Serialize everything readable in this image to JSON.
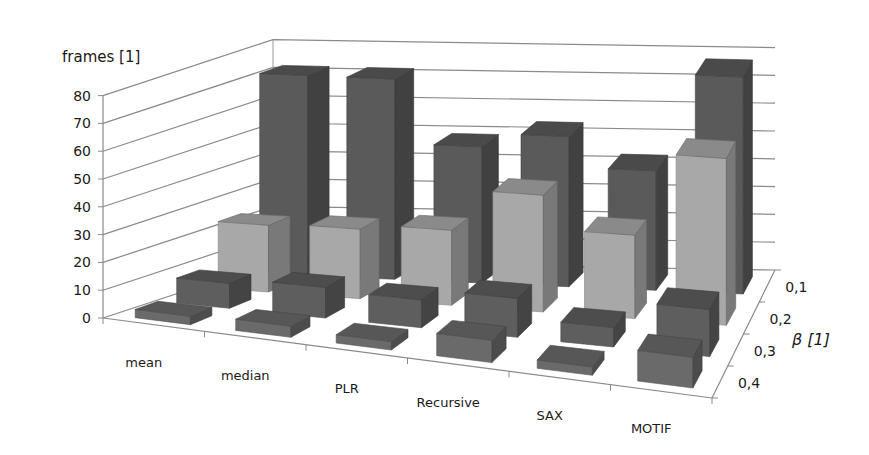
{
  "chart_data": {
    "type": "bar3d",
    "title": "",
    "ylabel": "frames [1]",
    "zlabel": "β [1]",
    "ylim": [
      0,
      80
    ],
    "yticks": [
      0,
      10,
      20,
      30,
      40,
      50,
      60,
      70,
      80
    ],
    "grid": true,
    "categories": [
      "mean",
      "median",
      "PLR",
      "Recursive",
      "SAX",
      "MOTIF"
    ],
    "series": [
      {
        "name": "0,1",
        "color": "#5a5a5a",
        "values": [
          72,
          72,
          49,
          54,
          43,
          78
        ]
      },
      {
        "name": "0,2",
        "color": "#a8a8a8",
        "values": [
          24,
          25,
          27,
          42,
          30,
          60
        ]
      },
      {
        "name": "0,3",
        "color": "#5e5e5e",
        "values": [
          9,
          11,
          10,
          14,
          7,
          17
        ]
      },
      {
        "name": "0,4",
        "color": "#6a6a6a",
        "values": [
          3,
          4,
          3,
          8,
          3,
          11
        ]
      }
    ]
  },
  "axis": {
    "y_title": "frames [1]",
    "z_title": "β [1]",
    "y_ticks": [
      "0",
      "10",
      "20",
      "30",
      "40",
      "50",
      "60",
      "70",
      "80"
    ],
    "z_ticks": [
      "0,1",
      "0,2",
      "0,3",
      "0,4"
    ],
    "x_ticks": [
      "mean",
      "median",
      "PLR",
      "Recursive",
      "SAX",
      "MOTIF"
    ]
  }
}
